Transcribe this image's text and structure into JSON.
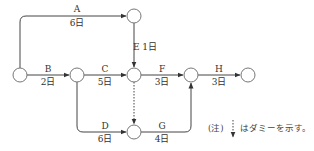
{
  "diagram": {
    "type": "arrow-network",
    "nodes": [
      {
        "id": "n1",
        "x": 20,
        "y": 75
      },
      {
        "id": "n2",
        "x": 77,
        "y": 75
      },
      {
        "id": "n3",
        "x": 134,
        "y": 16
      },
      {
        "id": "n4",
        "x": 134,
        "y": 75
      },
      {
        "id": "n5",
        "x": 134,
        "y": 132
      },
      {
        "id": "n6",
        "x": 191,
        "y": 75
      },
      {
        "id": "n7",
        "x": 248,
        "y": 75
      }
    ],
    "activities": [
      {
        "name": "A",
        "duration": "6日",
        "from": "n1",
        "to": "n3"
      },
      {
        "name": "B",
        "duration": "2日",
        "from": "n1",
        "to": "n2"
      },
      {
        "name": "C",
        "duration": "5日",
        "from": "n2",
        "to": "n4"
      },
      {
        "name": "D",
        "duration": "6日",
        "from": "n2",
        "to": "n5"
      },
      {
        "name": "E",
        "duration": "1日",
        "from": "n3",
        "to": "n4",
        "label": "E 1日"
      },
      {
        "name": "F",
        "duration": "3日",
        "from": "n4",
        "to": "n6"
      },
      {
        "name": "G",
        "duration": "4日",
        "from": "n5",
        "to": "n6"
      },
      {
        "name": "H",
        "duration": "3日",
        "from": "n6",
        "to": "n7"
      }
    ],
    "dummy": {
      "from": "n4",
      "to": "n5"
    },
    "note": {
      "prefix": "(注)",
      "text": "はダミーを示す。"
    }
  }
}
